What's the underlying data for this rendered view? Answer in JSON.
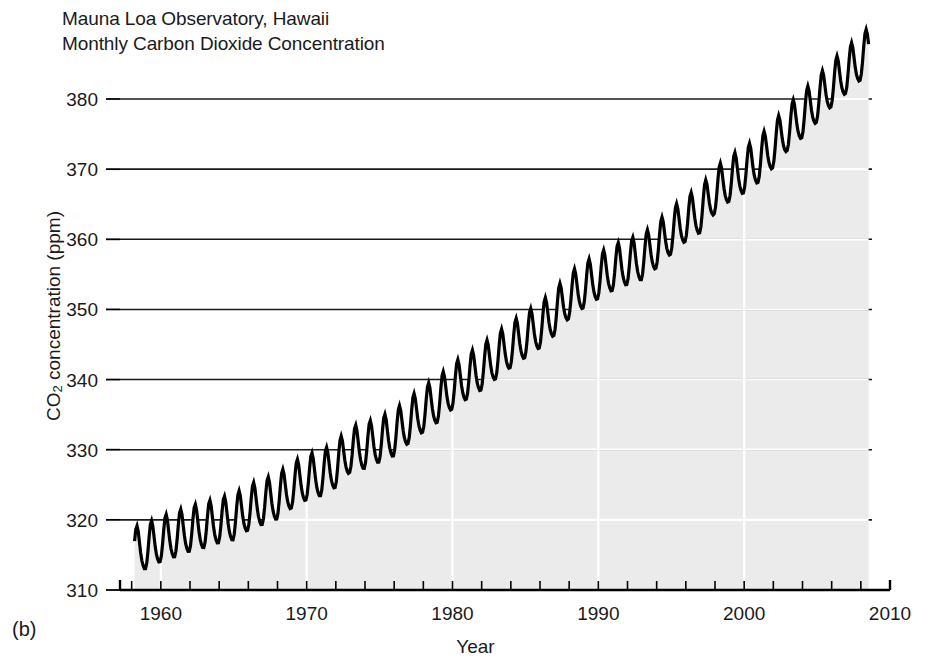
{
  "figure": {
    "panel_label": "(b)",
    "title_line1": "Mauna Loa Observatory, Hawaii",
    "title_line2": "Monthly Carbon Dioxide Concentration"
  },
  "colors": {
    "line": "#000000",
    "fill": "#ebebeb",
    "axis": "#000000",
    "gridline": "#1a1a1a",
    "gridline_over_fill": "#ffffff",
    "text": "#1a1a1a",
    "background": "#ffffff"
  },
  "chart_data": {
    "type": "line",
    "title": "Mauna Loa Observatory, Hawaii\nMonthly Carbon Dioxide Concentration",
    "xlabel": "Year",
    "ylabel": "CO2 concentration (ppm)",
    "ylabel_rich": "CO₂ concentration (ppm)",
    "xlim": [
      1957.2,
      2010.0
    ],
    "ylim": [
      310,
      386
    ],
    "grid": true,
    "grid_axis": "y",
    "legend": "none",
    "filled_under_curve": true,
    "y_ticks": [
      310,
      320,
      330,
      340,
      350,
      360,
      370,
      380
    ],
    "y_tick_labels": [
      "310",
      "320",
      "330",
      "340",
      "350",
      "360",
      "370",
      "380"
    ],
    "x_ticks": [
      1960,
      1970,
      1980,
      1990,
      2000,
      2010
    ],
    "x_tick_labels": [
      "1960",
      "1970",
      "1980",
      "1990",
      "2000",
      "2010"
    ],
    "x_minor_tick_interval": 2,
    "series_name": "Monthly mean CO2",
    "seasonal_amplitude_ppm": 3.2,
    "seasonal_peak_month": 5,
    "seasonal_trough_month": 10,
    "annual_trend": {
      "x": [
        1958,
        1959,
        1960,
        1961,
        1962,
        1963,
        1964,
        1965,
        1966,
        1967,
        1968,
        1969,
        1970,
        1971,
        1972,
        1973,
        1974,
        1975,
        1976,
        1977,
        1978,
        1979,
        1980,
        1981,
        1982,
        1983,
        1984,
        1985,
        1986,
        1987,
        1988,
        1989,
        1990,
        1991,
        1992,
        1993,
        1994,
        1995,
        1996,
        1997,
        1998,
        1999,
        2000,
        2001,
        2002,
        2003,
        2004,
        2005,
        2006,
        2007,
        2008
      ],
      "y": [
        315.3,
        315.9,
        316.9,
        317.6,
        318.4,
        318.9,
        319.6,
        320.0,
        321.4,
        322.2,
        323.0,
        324.6,
        325.7,
        326.3,
        327.5,
        329.7,
        330.2,
        331.1,
        332.0,
        333.8,
        335.4,
        336.8,
        338.7,
        340.1,
        341.4,
        343.0,
        344.6,
        346.0,
        347.4,
        349.2,
        351.6,
        353.1,
        354.4,
        355.6,
        356.4,
        357.1,
        358.8,
        360.8,
        362.6,
        363.8,
        366.6,
        368.3,
        369.5,
        371.0,
        373.1,
        375.6,
        377.4,
        379.6,
        381.8,
        383.7,
        385.6
      ]
    }
  }
}
